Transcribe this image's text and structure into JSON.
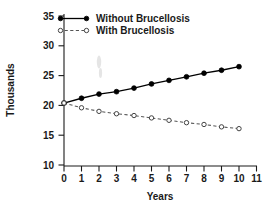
{
  "chart_data": {
    "type": "line",
    "title": "",
    "xlabel": "Years",
    "ylabel": "Thousands",
    "xlim": [
      0,
      11
    ],
    "ylim": [
      10,
      35
    ],
    "x": [
      0,
      1,
      2,
      3,
      4,
      5,
      6,
      7,
      8,
      9,
      10
    ],
    "xticks": [
      "0",
      "1",
      "2",
      "3",
      "4",
      "5",
      "6",
      "7",
      "8",
      "9",
      "10",
      "11"
    ],
    "xtick_values": [
      0,
      1,
      2,
      3,
      4,
      5,
      6,
      7,
      8,
      9,
      10,
      11
    ],
    "yticks": [
      "10",
      "15",
      "20",
      "25",
      "30",
      "35"
    ],
    "ytick_values": [
      10,
      15,
      20,
      25,
      30,
      35
    ],
    "grid": false,
    "legend_position": "top-left",
    "series": [
      {
        "name": "Without Brucellosis",
        "line_style": "solid",
        "marker": "filled-circle",
        "color": "#000000",
        "values": [
          20.4,
          21.2,
          21.9,
          22.3,
          22.9,
          23.6,
          24.2,
          24.8,
          25.4,
          25.9,
          26.5
        ]
      },
      {
        "name": "With Brucellosis",
        "line_style": "dashed",
        "marker": "open-circle",
        "color": "#555555",
        "values": [
          20.4,
          19.6,
          19.0,
          18.6,
          18.3,
          17.9,
          17.5,
          17.1,
          16.8,
          16.4,
          16.1
        ]
      }
    ]
  },
  "legend": {
    "entries": [
      {
        "label": "Without Brucellosis"
      },
      {
        "label": "With Brucellosis"
      }
    ]
  },
  "axes": {
    "y_title": "Thousands",
    "x_title": "Years"
  }
}
